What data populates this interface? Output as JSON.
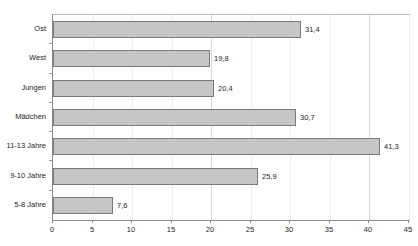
{
  "chart_data": {
    "type": "bar",
    "orientation": "horizontal",
    "title": "",
    "xlabel": "",
    "ylabel": "",
    "categories": [
      "Ost",
      "West",
      "Jungen",
      "Mädchen",
      "11-13 Jahre",
      "9-10 Jahre",
      "5-8 Jahre"
    ],
    "values": [
      31.4,
      19.8,
      20.4,
      30.7,
      41.3,
      25.9,
      7.6
    ],
    "value_labels": [
      "31,4",
      "19,8",
      "20,4",
      "30,7",
      "41,3",
      "25,9",
      "7,6"
    ],
    "xlim": [
      0,
      45
    ],
    "xticks": [
      0,
      5,
      10,
      15,
      20,
      25,
      30,
      35,
      40,
      45
    ],
    "xtick_labels": [
      "0",
      "5",
      "10",
      "15",
      "20",
      "25",
      "30",
      "35",
      "40",
      "45"
    ],
    "grid": true,
    "legend": false,
    "bar_color": "#c6c6c6",
    "bar_border_color": "#7a7a7a",
    "axis_color": "#8a8a8a",
    "grid_color": "#ededed",
    "text_color": "#1c1c1c"
  },
  "title_sliver": {
    "text": ""
  }
}
